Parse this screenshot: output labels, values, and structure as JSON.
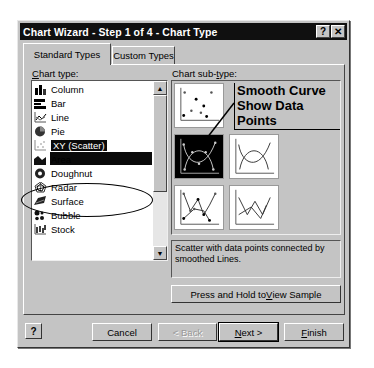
{
  "window": {
    "title": "Chart Wizard - Step 1 of 4 - Chart Type",
    "help_glyph": "?",
    "close_glyph": "✕"
  },
  "tabs": [
    {
      "label": "Standard Types",
      "active": true
    },
    {
      "label": "Custom Types",
      "active": false
    }
  ],
  "chart_type": {
    "label_prefix": "C",
    "label_rest": "hart type:",
    "items": [
      {
        "label": "Column",
        "icon": "column-chart-icon"
      },
      {
        "label": "Bar",
        "icon": "bar-chart-icon"
      },
      {
        "label": "Line",
        "icon": "line-chart-icon"
      },
      {
        "label": "Pie",
        "icon": "pie-chart-icon"
      },
      {
        "label": "XY (Scatter)",
        "icon": "scatter-chart-icon",
        "selected": true
      },
      {
        "label": "Area",
        "icon": "area-chart-icon"
      },
      {
        "label": "Doughnut",
        "icon": "doughnut-chart-icon"
      },
      {
        "label": "Radar",
        "icon": "radar-chart-icon"
      },
      {
        "label": "Surface",
        "icon": "surface-chart-icon"
      },
      {
        "label": "Bubble",
        "icon": "bubble-chart-icon"
      },
      {
        "label": "Stock",
        "icon": "stock-chart-icon"
      }
    ]
  },
  "chart_subtype": {
    "label_prefix": "Chart sub-",
    "label_u": "t",
    "label_rest": "ype:",
    "selected_index": 1,
    "annotation_line1": "Smooth Curve",
    "annotation_line2": "Show Data Points"
  },
  "description": "Scatter with data points connected by smoothed Lines.",
  "buttons": {
    "sample_pre": "Press and Hold to ",
    "sample_u": "V",
    "sample_post": "iew Sample",
    "help": "?",
    "cancel": "Cancel",
    "back": "< Back",
    "next_u": "N",
    "next_rest": "ext >",
    "finish_u": "F",
    "finish_rest": "inish"
  },
  "colors": {
    "dialog_bg": "#c4c4c4",
    "titlebar_bg": "#101010",
    "selection_bg": "#0a0a0a"
  }
}
